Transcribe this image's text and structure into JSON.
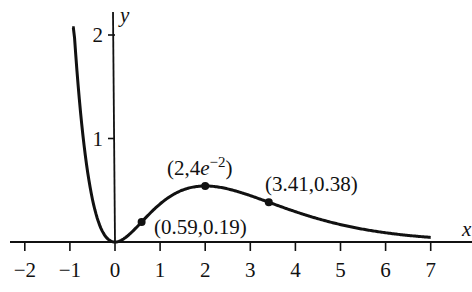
{
  "chart_data": {
    "type": "line",
    "title": "",
    "function": "y = x^2 e^(-x)",
    "xlabel": "x",
    "ylabel": "y",
    "x_ticks": [
      "-2",
      "-1",
      "0",
      "1",
      "2",
      "3",
      "4",
      "5",
      "6",
      "7"
    ],
    "y_ticks": [
      "1",
      "2"
    ],
    "xlim": [
      -2.2,
      7.9
    ],
    "ylim": [
      0,
      2.1
    ],
    "grid": false,
    "series": [
      {
        "name": "f(x)",
        "x_range": [
          -0.95,
          7
        ],
        "color": "#111111"
      }
    ],
    "points": [
      {
        "x": 0.59,
        "y": 0.19,
        "label": "(0.59,0.19)"
      },
      {
        "x": 2,
        "y": 0.54,
        "label": "(2,4e−2)"
      },
      {
        "x": 3.41,
        "y": 0.38,
        "label": "(3.41,0.38)"
      }
    ]
  },
  "labels": {
    "x_axis": "x",
    "y_axis": "y",
    "p1": "(0.59,0.19)",
    "p2_main": "(2,4",
    "p2_e": "e",
    "p2_exp": "−2",
    "p2_close": ")",
    "p3": "(3.41,0.38)",
    "xt": [
      "−2",
      "−1",
      "0",
      "1",
      "2",
      "3",
      "4",
      "5",
      "6",
      "7"
    ],
    "yt": [
      "1",
      "2"
    ]
  }
}
